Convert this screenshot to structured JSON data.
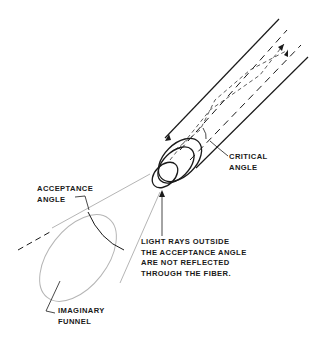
{
  "diagram": {
    "type": "optical-fiber-acceptance-angle",
    "labels": {
      "critical_angle": [
        "CRITICAL",
        "ANGLE"
      ],
      "acceptance_angle": [
        "ACCEPTANCE",
        "ANGLE"
      ],
      "light_rays_note": [
        "LIGHT RAYS OUTSIDE",
        "THE ACCEPTANCE ANGLE",
        "ARE NOT REFLECTED",
        "THROUGH THE FIBER."
      ],
      "imaginary_funnel": [
        "IMAGINARY",
        "FUNNEL"
      ]
    },
    "colors": {
      "line": "#1a1a1a",
      "funnel": "#b0b0b0",
      "background": "#ffffff"
    }
  }
}
